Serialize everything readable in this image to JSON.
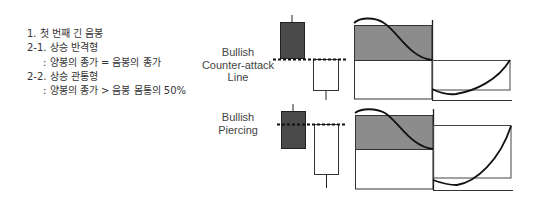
{
  "notes": [
    {
      "text": "1. 첫 번째 긴 음봉",
      "indent": false
    },
    {
      "text": "2-1. 상승 반격형",
      "indent": false
    },
    {
      "text": ": 양봉의 종가 = 음봉의 종가",
      "indent": true
    },
    {
      "text": "2-2. 상승 관통형",
      "indent": false
    },
    {
      "text": ": 양봉의 종가 > 음봉 몸통의 50%",
      "indent": true
    }
  ],
  "patterns": [
    {
      "name": "Bullish Counter-attack Line",
      "label_lines": [
        "Bullish",
        "Counter-attack",
        "Line"
      ]
    },
    {
      "name": "Bullish Piercing",
      "label_lines": [
        "Bullish",
        "Piercing"
      ]
    }
  ],
  "colors": {
    "bearish_candle": "#4a4a4a",
    "bullish_candle": "#ffffff",
    "shaded_area": "#8c8c8c",
    "line": "#222222"
  }
}
